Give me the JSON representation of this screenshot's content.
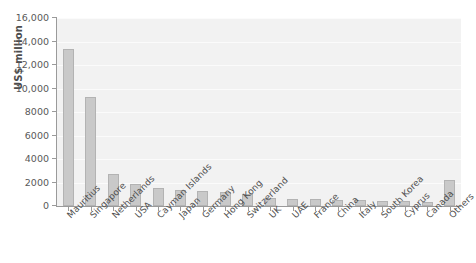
{
  "chart_data": {
    "type": "bar",
    "title": "",
    "xlabel": "",
    "ylabel": "US$ million",
    "ylim": [
      0,
      16000
    ],
    "grid": true,
    "legend": false,
    "ytick_labels": [
      "16,000",
      "14,000",
      "12,000",
      "10,000",
      "8000",
      "6000",
      "4000",
      "2000",
      "0"
    ],
    "ytick_values": [
      16000,
      14000,
      12000,
      10000,
      8000,
      6000,
      4000,
      2000,
      0
    ],
    "categories": [
      "Mauritius",
      "Singapore",
      "Netherlands",
      "USA",
      "Cayman Islands",
      "Japan",
      "Germany",
      "Hong Kong",
      "Switzerland",
      "UK",
      "UAE",
      "France",
      "China",
      "Italy",
      "South Korea",
      "Cyprus",
      "Canada",
      "Others"
    ],
    "values": [
      13400,
      9250,
      2700,
      1900,
      1500,
      1400,
      1300,
      1200,
      1000,
      700,
      620,
      560,
      520,
      480,
      440,
      400,
      380,
      2250
    ]
  },
  "colors": {
    "bar_fill": "#c9c9c9",
    "bar_stroke": "#b3b3b3",
    "plot_background": "#f2f2f2",
    "gridline": "#fbfbfb",
    "axis": "#9a9a9a",
    "tick_text": "#595959",
    "axis_title": "#4c4c4c"
  }
}
